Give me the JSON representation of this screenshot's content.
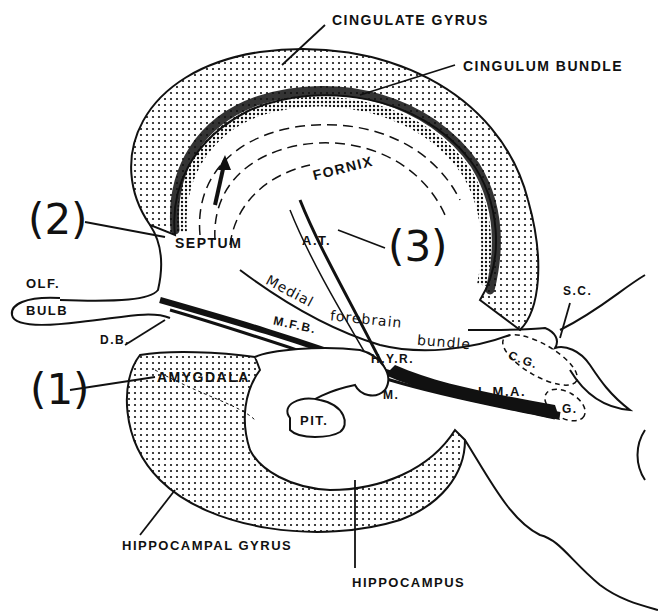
{
  "figure": {
    "type": "anatomical-diagram"
  },
  "labels": {
    "cingulate_gyrus": "CINGULATE GYRUS",
    "cingulum_bundle": "CINGULUM BUNDLE",
    "fornix": "FORNIX",
    "septum": "SEPTUM",
    "anterior_thalamus": "A.T.",
    "olf": "OLF.",
    "bulb": "BULB",
    "diagonal_band": "D.B.",
    "amygdala": "AMYGDALA",
    "pituitary": "PIT.",
    "mfb": "M.F.B.",
    "medial_forebrain_bundle_1": "Medial",
    "medial_forebrain_bundle_2": "forebrain",
    "medial_forebrain_bundle_3": "bundle",
    "hypothalamus": "H.Y.R.",
    "mammillary": "M.",
    "lma": "L.M.A.",
    "central_gray": "C.G.",
    "g": "G.",
    "superior_colliculus": "S.C.",
    "hippocampal_gyrus": "HIPPOCAMPAL GYRUS",
    "hippocampus": "HIPPOCAMPUS"
  },
  "callouts": {
    "one": "(1)",
    "two": "(2)",
    "three": "(3)"
  },
  "colors": {
    "ink": "#111111",
    "paper": "#ffffff"
  }
}
